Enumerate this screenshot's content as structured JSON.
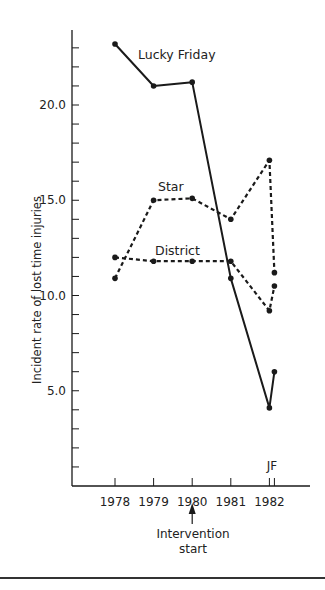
{
  "chart_data": {
    "type": "line",
    "title": "",
    "xlabel": "",
    "ylabel": "Incident rate of lost time injuries",
    "x": [
      "1978",
      "1979",
      "1980",
      "1981",
      "1982 J",
      "1982 F"
    ],
    "x_numeric": [
      1978,
      1979,
      1980,
      1981,
      1982,
      1982.13
    ],
    "x_tick_labels": [
      "1978",
      "1979",
      "1980",
      "1981",
      "1982"
    ],
    "x_tick_values": [
      1978,
      1979,
      1980,
      1981,
      1982,
      1982.13
    ],
    "sub_tick_label": "JF",
    "xlim": [
      1976.9,
      1983.1
    ],
    "y_tick_labels": [
      "5.0",
      "10.0",
      "15.0",
      "20.0"
    ],
    "y_tick_values": [
      5,
      10,
      15,
      20
    ],
    "y_minor_step": 1,
    "ylim": [
      0,
      25
    ],
    "grid": false,
    "legend": "inline-labels",
    "series": [
      {
        "name": "Lucky Friday",
        "style": "solid",
        "values": [
          23.2,
          21.0,
          21.2,
          10.9,
          4.1,
          6.0
        ]
      },
      {
        "name": "Star",
        "style": "dashed",
        "values": [
          10.9,
          15.0,
          15.1,
          14.0,
          17.1,
          11.2
        ]
      },
      {
        "name": "District",
        "style": "dashed",
        "values": [
          12.0,
          11.8,
          11.8,
          11.8,
          9.2,
          10.5
        ]
      }
    ],
    "annotations": [
      {
        "text_lines": [
          "Intervention",
          "start"
        ],
        "x": 1980,
        "type": "arrow-up"
      }
    ],
    "colors": {
      "ink": "#1a1a1a",
      "text": "#222222"
    }
  }
}
